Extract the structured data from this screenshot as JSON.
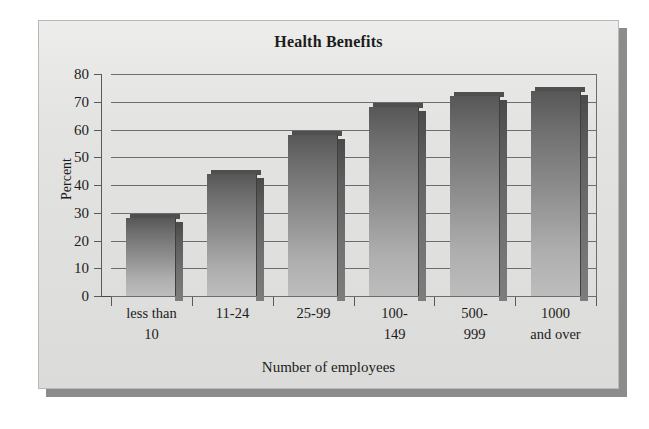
{
  "chart_data": {
    "type": "bar",
    "title": "Health Benefits",
    "xlabel": "Number of employees",
    "ylabel": "Percent",
    "categories": [
      "less than 10",
      "11-24",
      "25-99",
      "100-149",
      "500-999",
      "1000 and over"
    ],
    "category_lines": [
      [
        "less than",
        "10"
      ],
      [
        "11-24",
        ""
      ],
      [
        "25-99",
        ""
      ],
      [
        "100-",
        "149"
      ],
      [
        "500-",
        "999"
      ],
      [
        "1000",
        "and over"
      ]
    ],
    "values": [
      28,
      44,
      58,
      68,
      72,
      74
    ],
    "ylim": [
      0,
      80
    ],
    "ytick_step": 10,
    "yticks": [
      80,
      70,
      60,
      50,
      40,
      30,
      20,
      10,
      0
    ],
    "ytick_labels": [
      "80",
      "70",
      "60",
      "50",
      "40",
      "30",
      "20",
      "10",
      "0"
    ],
    "grid": true,
    "legend": "none",
    "colors": {
      "bar_top": "#575757",
      "bar_bottom": "#bdbdbd",
      "bar_side": "#4a4a4a",
      "panel_background": "#e3e3e1",
      "gridline": "#6d6d6d",
      "axis": "#4a4a4a",
      "text": "#1c1c1c",
      "page_background": "#ffffff",
      "shadow": "#8c8c8c"
    }
  }
}
